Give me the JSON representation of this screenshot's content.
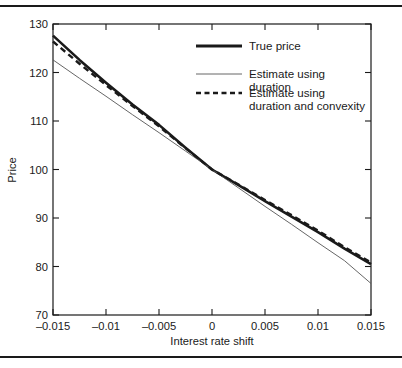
{
  "figure": {
    "background": "#ffffff",
    "axis_color": "#1a1a1a",
    "rule_top": true,
    "rule_bottom": true
  },
  "chart_data": {
    "type": "line",
    "title": "",
    "xlabel": "Interest rate shift",
    "ylabel": "Price",
    "xlim": [
      -0.015,
      0.015
    ],
    "ylim": [
      70,
      130
    ],
    "xticks": [
      -0.015,
      -0.01,
      -0.005,
      0,
      0.005,
      0.01,
      0.015
    ],
    "xticklabels": [
      "–0.015",
      "–0.01",
      "–0.005",
      "0",
      "0.005",
      "0.01",
      "0.015"
    ],
    "yticks": [
      70,
      80,
      90,
      100,
      110,
      120,
      130
    ],
    "yticklabels": [
      "70",
      "80",
      "90",
      "100",
      "110",
      "120",
      "130"
    ],
    "grid": false,
    "legend_position": "upper right",
    "x": [
      -0.015,
      -0.0125,
      -0.01,
      -0.0075,
      -0.005,
      -0.0025,
      0,
      0.0025,
      0.005,
      0.0075,
      0.01,
      0.0125,
      0.015
    ],
    "series": [
      {
        "name": "True price",
        "style": "solid",
        "linewidth": 2.6,
        "color": "#1a1a1a",
        "values": [
          127.6,
          122.6,
          117.9,
          113.4,
          109.2,
          104.5,
          100.0,
          96.8,
          93.5,
          90.3,
          87.1,
          83.7,
          80.5
        ]
      },
      {
        "name": "Estimate using duration",
        "style": "solid",
        "linewidth": 0.9,
        "color": "#555555",
        "values": [
          122.6,
          118.8,
          115.1,
          111.3,
          107.6,
          103.8,
          100.0,
          96.2,
          92.4,
          88.7,
          84.9,
          81.2,
          76.5
        ]
      },
      {
        "name": "Estimate using duration and convexity",
        "style": "dashed",
        "linewidth": 2.4,
        "color": "#1a1a1a",
        "values": [
          126.4,
          121.8,
          117.4,
          113.1,
          108.9,
          104.4,
          100.0,
          96.9,
          93.7,
          90.6,
          87.4,
          84.0,
          80.8
        ]
      }
    ],
    "legend": [
      {
        "label_line1": "True price",
        "label_line2": "",
        "style": "solid-thick"
      },
      {
        "label_line1": "Estimate using",
        "label_line2": "duration",
        "style": "solid-thin"
      },
      {
        "label_line1": "Estimate using",
        "label_line2": "duration and convexity",
        "style": "dashed-thick"
      }
    ]
  }
}
